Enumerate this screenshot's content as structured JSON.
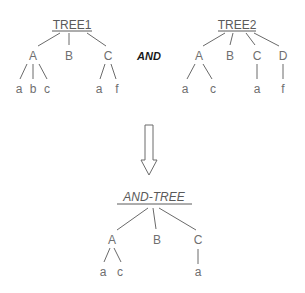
{
  "operator": "AND",
  "trees": [
    {
      "id": "tree1",
      "title": "TREE1",
      "children": [
        {
          "label": "A",
          "children": [
            "a",
            "b",
            "c"
          ]
        },
        {
          "label": "B",
          "children": []
        },
        {
          "label": "C",
          "children": [
            "a",
            "f"
          ]
        }
      ]
    },
    {
      "id": "tree2",
      "title": "TREE2",
      "children": [
        {
          "label": "A",
          "children": [
            "a",
            "c"
          ]
        },
        {
          "label": "B",
          "children": []
        },
        {
          "label": "C",
          "children": [
            "a"
          ]
        },
        {
          "label": "D",
          "children": [
            "f"
          ]
        }
      ]
    },
    {
      "id": "and-tree",
      "title": "AND-TREE",
      "children": [
        {
          "label": "A",
          "children": [
            "a",
            "c"
          ]
        },
        {
          "label": "B",
          "children": []
        },
        {
          "label": "C",
          "children": [
            "a"
          ]
        }
      ]
    }
  ],
  "arrow": "down-arrow-icon"
}
